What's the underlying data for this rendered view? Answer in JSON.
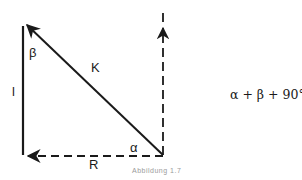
{
  "diagram": {
    "labels": {
      "beta": "β",
      "k": "K",
      "l": "l",
      "alpha": "α",
      "r": "R"
    },
    "equation": "α + β + 90° = 180°",
    "caption": "Abbildung 1.7"
  },
  "colors": {
    "stroke": "#1a1a1a",
    "background": "#ffffff"
  }
}
